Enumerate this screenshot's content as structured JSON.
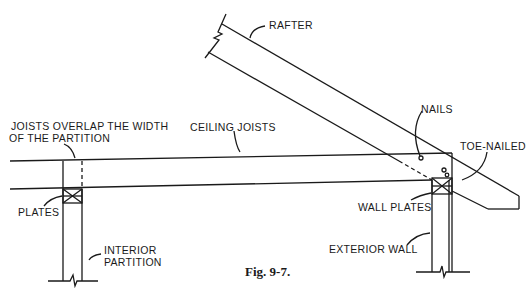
{
  "figure": {
    "caption": "Fig. 9-7.",
    "labels": {
      "rafter": "RAFTER",
      "nails": "NAILS",
      "toe_nailed": "TOE-NAILED",
      "ceiling_joists": "CEILING JOISTS",
      "joists_overlap_line1": "JOISTS OVERLAP THE WIDTH",
      "joists_overlap_line2": "OF THE PARTITION",
      "plates": "PLATES",
      "wall_plates": "WALL PLATES",
      "interior_partition_line1": "INTERIOR",
      "interior_partition_line2": "PARTITION",
      "exterior_wall": "EXTERIOR WALL"
    },
    "colors": {
      "line": "#1a1a1a",
      "background": "#ffffff"
    }
  }
}
